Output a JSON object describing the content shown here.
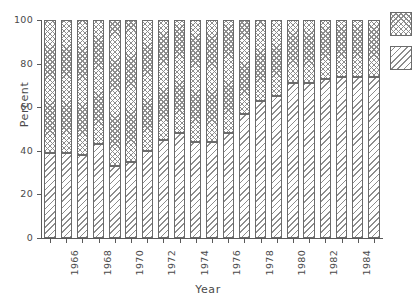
{
  "chart_data": {
    "type": "bar",
    "subtype": "stacked-100-percent",
    "title": "",
    "xlabel": "Year",
    "ylabel": "Percent",
    "ylim": [
      0,
      100
    ],
    "yticks": [
      0,
      20,
      40,
      60,
      80,
      100
    ],
    "grid": false,
    "legend_position": "right",
    "categories": [
      "1965",
      "1966",
      "1967",
      "1968",
      "1969",
      "1970",
      "1971",
      "1972",
      "1973",
      "1974",
      "1975",
      "1976",
      "1977",
      "1978",
      "1979",
      "1980",
      "1981",
      "1982",
      "1983",
      "1984",
      "1985"
    ],
    "xtick_labels": [
      "1966",
      "1968",
      "1970",
      "1972",
      "1974",
      "1976",
      "1978",
      "1980",
      "1982",
      "1984"
    ],
    "xtick_categories": [
      "1966",
      "1968",
      "1970",
      "1972",
      "1974",
      "1976",
      "1978",
      "1980",
      "1982",
      "1984"
    ],
    "series": [
      {
        "name": "lower-series",
        "pattern": "diagonal-hatch",
        "values": [
          39,
          39,
          38,
          43,
          33,
          35,
          40,
          45,
          48,
          44,
          44,
          48,
          57,
          63,
          65,
          71,
          71,
          73,
          74,
          74,
          74
        ]
      },
      {
        "name": "upper-series",
        "pattern": "cross-hatch",
        "values": [
          61,
          61,
          62,
          57,
          67,
          65,
          60,
          55,
          52,
          56,
          56,
          52,
          43,
          37,
          35,
          29,
          29,
          27,
          26,
          26,
          26
        ]
      }
    ],
    "legend_entries": [
      {
        "label": "",
        "pattern": "cross-hatch"
      },
      {
        "label": "",
        "pattern": "diagonal-hatch"
      }
    ],
    "colors": {
      "axis": "#5a5a5a",
      "bar_outline": "#6b6b6b",
      "hatch": "#8d8d8d",
      "background": "#ffffff",
      "text": "#4a4a4a"
    }
  }
}
